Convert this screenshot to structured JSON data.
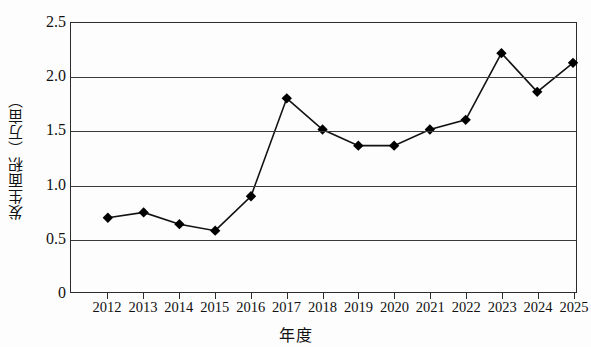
{
  "chart_data": {
    "type": "line",
    "title": "",
    "subtitle": "",
    "xlabel": "年度",
    "ylabel": "发生面积（万亩）",
    "categories": [
      "2012",
      "2013",
      "2014",
      "2015",
      "2016",
      "2017",
      "2018",
      "2019",
      "2020",
      "2021",
      "2022",
      "2023",
      "2024",
      "2025"
    ],
    "values": [
      0.69,
      0.74,
      0.63,
      0.57,
      0.89,
      1.8,
      1.51,
      1.36,
      1.36,
      1.51,
      1.6,
      2.22,
      1.86,
      2.13
    ],
    "series": [
      {
        "name": "发生面积",
        "values": [
          0.69,
          0.74,
          0.63,
          0.57,
          0.89,
          1.8,
          1.51,
          1.36,
          1.36,
          1.51,
          1.6,
          2.22,
          1.86,
          2.13
        ]
      }
    ],
    "ylim": [
      0,
      2.5
    ],
    "ytick_labels": [
      "2.5",
      "2.0",
      "1.5",
      "1.0",
      "0.5",
      "0"
    ],
    "ytick_values": [
      2.5,
      2.0,
      1.5,
      1.0,
      0.5,
      0
    ],
    "xlim": [
      "2012",
      "2025"
    ],
    "grid": "horizontal",
    "legend": "none",
    "marker": "diamond",
    "line_color": "#111111",
    "marker_color": "#000000",
    "grid_color": "#3a3a3a",
    "axis_color": "#2b2b2b",
    "background_color": "#fdfdfd"
  },
  "axes": {
    "y_title": "发生面积（万亩）",
    "x_title": "年度"
  }
}
